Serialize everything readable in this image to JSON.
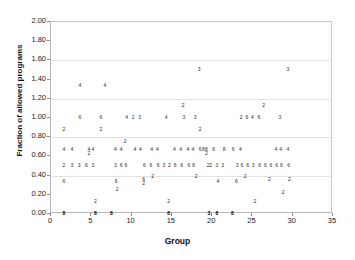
{
  "chart_data": {
    "type": "scatter",
    "title": "",
    "xlabel": "Group",
    "ylabel": "Fraction of allowed programs",
    "xlim": [
      0,
      35
    ],
    "ylim": [
      0,
      2.0
    ],
    "xticks": [
      "0",
      "5",
      "10",
      "15",
      "20",
      "25",
      "30",
      "35"
    ],
    "xtick_values": [
      0,
      5,
      10,
      15,
      20,
      25,
      30,
      35
    ],
    "yticks": [
      "0.00",
      "0.20",
      "0.40",
      "0.60",
      "0.80",
      "1.00",
      "1.20",
      "1.40",
      "1.60",
      "1.80",
      "2.00"
    ],
    "ytick_values": [
      0.0,
      0.2,
      0.4,
      0.6,
      0.8,
      1.0,
      1.2,
      1.4,
      1.6,
      1.8,
      2.0
    ],
    "grid": "horizontal-major",
    "gridline_values": [
      0.4,
      0.8,
      1.2,
      1.6
    ],
    "legend": "none",
    "marker_style": "numeric-label",
    "marker_note": "Each plotted point is drawn as a small numeral giving the denominator (number of programs) for that group.",
    "points": [
      {
        "x": 1.6,
        "y": 0.0,
        "label": "8"
      },
      {
        "x": 1.6,
        "y": 0.33,
        "label": "6"
      },
      {
        "x": 1.6,
        "y": 0.5,
        "label": "2"
      },
      {
        "x": 1.6,
        "y": 0.67,
        "label": "4"
      },
      {
        "x": 1.6,
        "y": 0.87,
        "label": "2"
      },
      {
        "x": 2.6,
        "y": 0.5,
        "label": "3"
      },
      {
        "x": 2.6,
        "y": 0.67,
        "label": "4"
      },
      {
        "x": 3.5,
        "y": 0.5,
        "label": "3"
      },
      {
        "x": 3.6,
        "y": 1.0,
        "label": "6"
      },
      {
        "x": 4.4,
        "y": 0.5,
        "label": "6"
      },
      {
        "x": 4.7,
        "y": 0.62,
        "label": "2"
      },
      {
        "x": 4.7,
        "y": 0.67,
        "label": "4"
      },
      {
        "x": 5.2,
        "y": 0.67,
        "label": "4"
      },
      {
        "x": 5.2,
        "y": 0.5,
        "label": "3"
      },
      {
        "x": 5.5,
        "y": 0.0,
        "label": "8"
      },
      {
        "x": 5.5,
        "y": 0.13,
        "label": "2"
      },
      {
        "x": 6.2,
        "y": 1.0,
        "label": "6"
      },
      {
        "x": 6.2,
        "y": 0.87,
        "label": "2"
      },
      {
        "x": 6.7,
        "y": 1.33,
        "label": "4"
      },
      {
        "x": 3.6,
        "y": 1.33,
        "label": "4"
      },
      {
        "x": 7.5,
        "y": 0.0,
        "label": "8"
      },
      {
        "x": 8.0,
        "y": 0.67,
        "label": "4"
      },
      {
        "x": 8.0,
        "y": 0.5,
        "label": "3"
      },
      {
        "x": 8.1,
        "y": 0.33,
        "label": "6"
      },
      {
        "x": 8.2,
        "y": 0.25,
        "label": "2"
      },
      {
        "x": 8.7,
        "y": 0.67,
        "label": "4"
      },
      {
        "x": 8.7,
        "y": 0.5,
        "label": "6"
      },
      {
        "x": 9.2,
        "y": 0.75,
        "label": "2"
      },
      {
        "x": 9.3,
        "y": 0.5,
        "label": "6"
      },
      {
        "x": 9.4,
        "y": 1.0,
        "label": "4"
      },
      {
        "x": 10.2,
        "y": 1.0,
        "label": "2"
      },
      {
        "x": 10.4,
        "y": 0.67,
        "label": "4"
      },
      {
        "x": 11.0,
        "y": 1.0,
        "label": "3"
      },
      {
        "x": 11.1,
        "y": 0.67,
        "label": "4"
      },
      {
        "x": 11.5,
        "y": 0.35,
        "label": "6"
      },
      {
        "x": 11.5,
        "y": 0.31,
        "label": "2"
      },
      {
        "x": 11.6,
        "y": 0.5,
        "label": "6"
      },
      {
        "x": 12.4,
        "y": 0.5,
        "label": "6"
      },
      {
        "x": 12.5,
        "y": 0.67,
        "label": "4"
      },
      {
        "x": 12.6,
        "y": 0.39,
        "label": "2"
      },
      {
        "x": 13.2,
        "y": 0.67,
        "label": "4"
      },
      {
        "x": 13.3,
        "y": 0.5,
        "label": "6"
      },
      {
        "x": 14.0,
        "y": 0.5,
        "label": "3"
      },
      {
        "x": 14.3,
        "y": 1.0,
        "label": "4"
      },
      {
        "x": 14.6,
        "y": 0.0,
        "label": "8"
      },
      {
        "x": 14.6,
        "y": 0.13,
        "label": "2"
      },
      {
        "x": 14.7,
        "y": 0.5,
        "label": "2"
      },
      {
        "x": 15.3,
        "y": 0.67,
        "label": "4"
      },
      {
        "x": 15.4,
        "y": 0.5,
        "label": "6"
      },
      {
        "x": 16.1,
        "y": 0.67,
        "label": "4"
      },
      {
        "x": 16.2,
        "y": 0.5,
        "label": "6"
      },
      {
        "x": 16.4,
        "y": 1.13,
        "label": "2"
      },
      {
        "x": 16.5,
        "y": 1.0,
        "label": "3"
      },
      {
        "x": 17.0,
        "y": 0.67,
        "label": "4"
      },
      {
        "x": 17.1,
        "y": 0.5,
        "label": "6"
      },
      {
        "x": 17.6,
        "y": 0.67,
        "label": "4"
      },
      {
        "x": 17.7,
        "y": 0.5,
        "label": "6"
      },
      {
        "x": 17.9,
        "y": 1.0,
        "label": "3"
      },
      {
        "x": 18.0,
        "y": 0.39,
        "label": "2"
      },
      {
        "x": 18.4,
        "y": 1.5,
        "label": "3"
      },
      {
        "x": 18.5,
        "y": 0.87,
        "label": "2"
      },
      {
        "x": 18.5,
        "y": 0.67,
        "label": "6"
      },
      {
        "x": 18.9,
        "y": 0.67,
        "label": "8"
      },
      {
        "x": 19.3,
        "y": 0.67,
        "label": "8"
      },
      {
        "x": 19.3,
        "y": 0.62,
        "label": "2"
      },
      {
        "x": 19.5,
        "y": 0.5,
        "label": "2"
      },
      {
        "x": 19.6,
        "y": 0.0,
        "label": "3"
      },
      {
        "x": 19.8,
        "y": 0.5,
        "label": "2"
      },
      {
        "x": 20.2,
        "y": 0.67,
        "label": "6"
      },
      {
        "x": 20.6,
        "y": 0.0,
        "label": "8"
      },
      {
        "x": 20.7,
        "y": 0.33,
        "label": "4"
      },
      {
        "x": 20.6,
        "y": 0.5,
        "label": "3"
      },
      {
        "x": 21.3,
        "y": 0.5,
        "label": "3"
      },
      {
        "x": 21.5,
        "y": 0.67,
        "label": "8"
      },
      {
        "x": 22.5,
        "y": 0.0,
        "label": "8"
      },
      {
        "x": 22.6,
        "y": 0.67,
        "label": "6"
      },
      {
        "x": 23.0,
        "y": 0.33,
        "label": "6"
      },
      {
        "x": 23.1,
        "y": 0.5,
        "label": "3"
      },
      {
        "x": 23.5,
        "y": 0.67,
        "label": "4"
      },
      {
        "x": 23.6,
        "y": 1.0,
        "label": "2"
      },
      {
        "x": 23.7,
        "y": 0.5,
        "label": "6"
      },
      {
        "x": 24.1,
        "y": 0.39,
        "label": "2"
      },
      {
        "x": 24.3,
        "y": 1.0,
        "label": "6"
      },
      {
        "x": 24.4,
        "y": 0.5,
        "label": "6"
      },
      {
        "x": 25.0,
        "y": 1.0,
        "label": "4"
      },
      {
        "x": 25.1,
        "y": 0.5,
        "label": "3"
      },
      {
        "x": 25.3,
        "y": 0.13,
        "label": "2"
      },
      {
        "x": 25.8,
        "y": 1.0,
        "label": "6"
      },
      {
        "x": 25.9,
        "y": 0.5,
        "label": "6"
      },
      {
        "x": 26.4,
        "y": 1.13,
        "label": "2"
      },
      {
        "x": 26.6,
        "y": 0.5,
        "label": "6"
      },
      {
        "x": 27.1,
        "y": 0.35,
        "label": "2"
      },
      {
        "x": 27.3,
        "y": 0.5,
        "label": "6"
      },
      {
        "x": 27.9,
        "y": 0.67,
        "label": "4"
      },
      {
        "x": 28.0,
        "y": 0.5,
        "label": "6"
      },
      {
        "x": 28.4,
        "y": 1.0,
        "label": "3"
      },
      {
        "x": 28.5,
        "y": 0.67,
        "label": "4"
      },
      {
        "x": 28.6,
        "y": 0.5,
        "label": "6"
      },
      {
        "x": 28.8,
        "y": 0.22,
        "label": "2"
      },
      {
        "x": 29.4,
        "y": 1.5,
        "label": "3"
      },
      {
        "x": 29.4,
        "y": 0.67,
        "label": "4"
      },
      {
        "x": 29.5,
        "y": 0.5,
        "label": "6"
      },
      {
        "x": 29.6,
        "y": 0.35,
        "label": "2"
      }
    ]
  }
}
